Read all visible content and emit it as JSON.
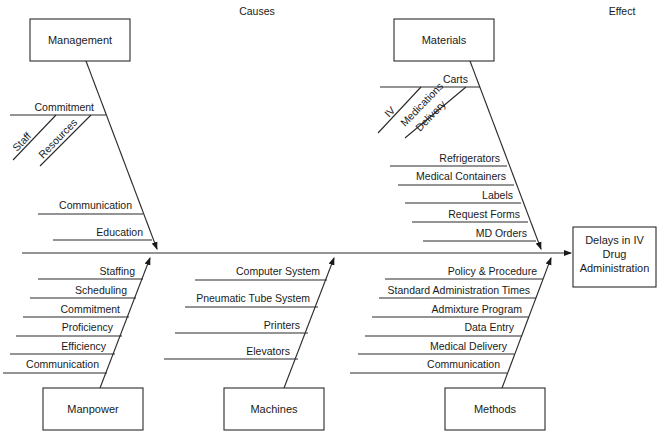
{
  "headers": {
    "causes": "Causes",
    "effect": "Effect"
  },
  "effect": {
    "line1": "Delays in IV",
    "line2": "Drug",
    "line3": "Administration"
  },
  "categories": {
    "management": {
      "label": "Management",
      "causes": [
        "Commitment",
        "Communication",
        "Education"
      ],
      "sub_causes": {
        "Commitment": [
          "Staff",
          "Resources"
        ]
      }
    },
    "materials": {
      "label": "Materials",
      "causes": [
        "Carts",
        "Refrigerators",
        "Medical Containers",
        "Labels",
        "Request Forms",
        "MD Orders"
      ],
      "sub_causes": {
        "Carts": [
          "IV",
          "Medications Delivery"
        ]
      },
      "sub_cause_lines": {
        "medications": "Medications",
        "delivery": "Delivery"
      }
    },
    "manpower": {
      "label": "Manpower",
      "causes": [
        "Staffing",
        "Scheduling",
        "Commitment",
        "Proficiency",
        "Efficiency",
        "Communication"
      ]
    },
    "machines": {
      "label": "Machines",
      "causes": [
        "Computer System",
        "Pneumatic Tube System",
        "Printers",
        "Elevators"
      ]
    },
    "methods": {
      "label": "Methods",
      "causes": [
        "Policy & Procedure",
        "Standard Administration Times",
        "Admixture Program",
        "Data Entry",
        "Medical Delivery",
        "Communication"
      ]
    }
  }
}
